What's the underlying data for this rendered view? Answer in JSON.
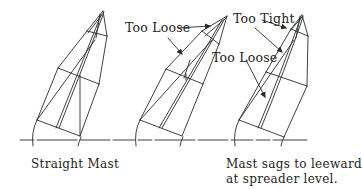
{
  "figure": {
    "masts": [
      {
        "id": "straight",
        "caption": "Straight Mast"
      },
      {
        "id": "middle",
        "caption": ""
      },
      {
        "id": "sagging",
        "caption_lines": [
          "Mast sags to leeward",
          "at spreader level."
        ]
      }
    ],
    "labels": {
      "m2_upper": "Too Loose",
      "m3_upper": "Too Tight",
      "m3_lower": "Too Loose"
    },
    "captions": {
      "left": "Straight Mast",
      "right_line1": "Mast sags to leeward",
      "right_line2": "at spreader level."
    },
    "colors": {
      "ink": "#2a2a2a",
      "background": "#ffffff"
    }
  }
}
